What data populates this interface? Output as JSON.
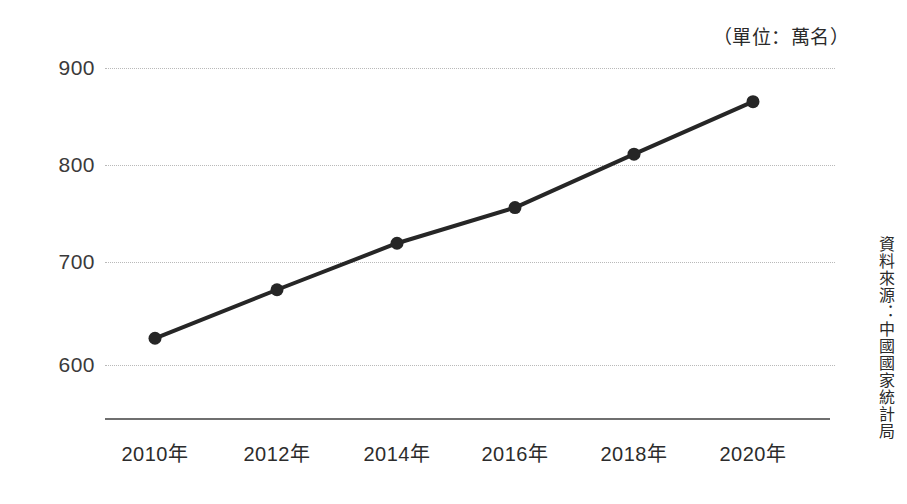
{
  "annotations": {
    "unit_note": "（單位：萬名）",
    "source_note": "資料來源：中國國家統計局"
  },
  "chart_data": {
    "type": "line",
    "title": "",
    "subtitle": "",
    "xlabel": "",
    "ylabel": "",
    "unit_label": "（單位：萬名）",
    "source": "資料來源：中國國家統計局",
    "categories": [
      "2010年",
      "2012年",
      "2014年",
      "2016年",
      "2018年",
      "2020年"
    ],
    "x_tick_labels": [
      "2010年",
      "2012年",
      "2014年",
      "2016年",
      "2018年",
      "2020年"
    ],
    "y_tick_labels": [
      "900",
      "800",
      "700",
      "600"
    ],
    "y_ticks": [
      900,
      800,
      700,
      600
    ],
    "ylim": [
      565,
      935
    ],
    "grid": true,
    "grid_style": "dotted-horizontal",
    "legend": false,
    "legend_position": "none",
    "series": [
      {
        "name": "",
        "values": [
          627,
          676,
          723,
          759,
          813,
          866
        ],
        "color": "#262626",
        "marker": "circle",
        "marker_size": 13,
        "line_width": 4
      }
    ],
    "colors": {
      "line": "#262626",
      "marker": "#262626",
      "grid": "#b9b9b9",
      "axis": "#6f6f6f",
      "text": "#2c2c2c",
      "background": "#ffffff"
    }
  },
  "geometry": {
    "plot_left": 105,
    "plot_right": 835,
    "axis_y": 418,
    "y_pixel_for": {
      "900": 68,
      "800": 165,
      "700": 262,
      "600": 365
    },
    "point_x": [
      155,
      277,
      397,
      515,
      634,
      753
    ],
    "point_y": [
      338,
      290,
      240,
      207,
      155,
      102
    ]
  }
}
